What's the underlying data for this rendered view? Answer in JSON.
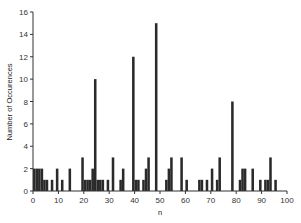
{
  "chart_data": {
    "type": "bar",
    "title": "",
    "xlabel": "n",
    "ylabel": "Number of Occurences",
    "xlim": [
      0,
      100
    ],
    "ylim": [
      0,
      16
    ],
    "xticks": [
      0,
      10,
      20,
      30,
      40,
      50,
      60,
      70,
      80,
      90,
      100
    ],
    "yticks": [
      0,
      2,
      4,
      6,
      8,
      10,
      12,
      14,
      16
    ],
    "grid": false,
    "legend": null,
    "bar_color": "#2a2a2a",
    "bin_width": 1,
    "x": [
      0,
      1,
      2,
      3,
      4,
      5,
      6,
      7,
      8,
      9,
      10,
      11,
      12,
      13,
      14,
      15,
      16,
      17,
      18,
      19,
      20,
      21,
      22,
      23,
      24,
      25,
      26,
      27,
      28,
      29,
      30,
      31,
      32,
      33,
      34,
      35,
      36,
      37,
      38,
      39,
      40,
      41,
      42,
      43,
      44,
      45,
      46,
      47,
      48,
      49,
      50,
      51,
      52,
      53,
      54,
      55,
      56,
      57,
      58,
      59,
      60,
      61,
      62,
      63,
      64,
      65,
      66,
      67,
      68,
      69,
      70,
      71,
      72,
      73,
      74,
      75,
      76,
      77,
      78,
      79,
      80,
      81,
      82,
      83,
      84,
      85,
      86,
      87,
      88,
      89,
      90,
      91,
      92,
      93,
      94,
      95,
      96,
      97,
      98,
      99
    ],
    "values": [
      2,
      2,
      2,
      2,
      1,
      1,
      0,
      1,
      0,
      2,
      0,
      1,
      0,
      0,
      2,
      0,
      0,
      0,
      0,
      3,
      1,
      1,
      1,
      2,
      10,
      1,
      1,
      1,
      0,
      1,
      0,
      3,
      0,
      0,
      1,
      2,
      0,
      0,
      0,
      12,
      1,
      1,
      0,
      1,
      2,
      3,
      0,
      0,
      15,
      0,
      0,
      0,
      1,
      2,
      3,
      0,
      0,
      0,
      3,
      0,
      1,
      0,
      0,
      0,
      0,
      1,
      1,
      0,
      1,
      0,
      2,
      0,
      1,
      3,
      0,
      0,
      0,
      0,
      8,
      0,
      0,
      1,
      2,
      2,
      0,
      0,
      2,
      0,
      0,
      1,
      0,
      1,
      1,
      3,
      0,
      1,
      0,
      0,
      0,
      0
    ]
  }
}
